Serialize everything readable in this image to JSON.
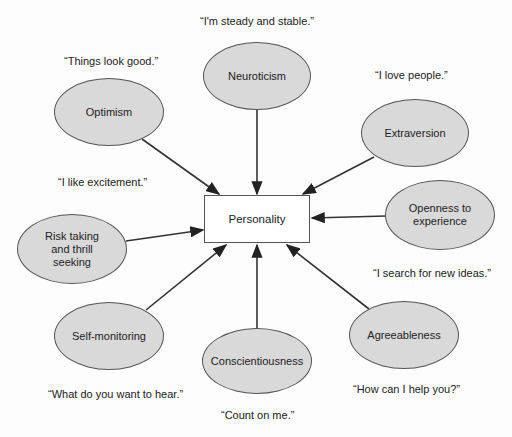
{
  "center": {
    "label": "Personality"
  },
  "traits": [
    {
      "id": "neuroticism",
      "label": "Neuroticism",
      "quote": "“I'm steady and stable.”"
    },
    {
      "id": "optimism",
      "label": "Optimism",
      "quote": "“Things look good.”"
    },
    {
      "id": "extraversion",
      "label": "Extraversion",
      "quote": "“I love people.”"
    },
    {
      "id": "risk-taking",
      "label": "Risk taking\nand thrill\nseeking",
      "quote": "“I like excitement.”"
    },
    {
      "id": "openness",
      "label": "Openness to\nexperience",
      "quote": "“I search for new ideas.”"
    },
    {
      "id": "self-monitoring",
      "label": "Self-monitoring",
      "quote": "“What do you want to hear.”"
    },
    {
      "id": "conscientiousness",
      "label": "Conscientiousness",
      "quote": "“Count on me.”"
    },
    {
      "id": "agreeableness",
      "label": "Agreeableness",
      "quote": "“How can I help you?”"
    }
  ],
  "colors": {
    "ellipse_fill": "#d9d9d9",
    "stroke": "#333333",
    "box_fill": "#ffffff"
  }
}
